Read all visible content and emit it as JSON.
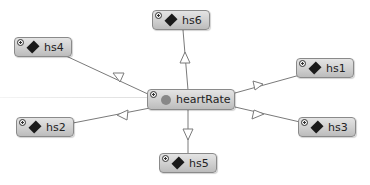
{
  "diagram": {
    "center": {
      "id": "heartRate",
      "label": "heartRate",
      "icon": "circle-icon",
      "icon_color": "#888888"
    },
    "nodes": [
      {
        "id": "hs6",
        "label": "hs6",
        "icon": "diamond-icon"
      },
      {
        "id": "hs4",
        "label": "hs4",
        "icon": "diamond-icon"
      },
      {
        "id": "hs1",
        "label": "hs1",
        "icon": "diamond-icon"
      },
      {
        "id": "hs2",
        "label": "hs2",
        "icon": "diamond-icon"
      },
      {
        "id": "hs3",
        "label": "hs3",
        "icon": "diamond-icon"
      },
      {
        "id": "hs5",
        "label": "hs5",
        "icon": "diamond-icon"
      }
    ],
    "edges": [
      {
        "from": "heartRate",
        "to": "hs6",
        "arrow": "hollow-triangle"
      },
      {
        "from": "heartRate",
        "to": "hs4",
        "arrow": "hollow-triangle"
      },
      {
        "from": "heartRate",
        "to": "hs1",
        "arrow": "hollow-triangle"
      },
      {
        "from": "heartRate",
        "to": "hs2",
        "arrow": "hollow-triangle"
      },
      {
        "from": "heartRate",
        "to": "hs3",
        "arrow": "hollow-triangle"
      },
      {
        "from": "heartRate",
        "to": "hs5",
        "arrow": "hollow-triangle"
      }
    ],
    "expand_icon": "plus-circle-icon",
    "node_fill": "#d0d0d0",
    "node_border": "#8a8a8a",
    "edge_color": "#7a7a7a"
  }
}
